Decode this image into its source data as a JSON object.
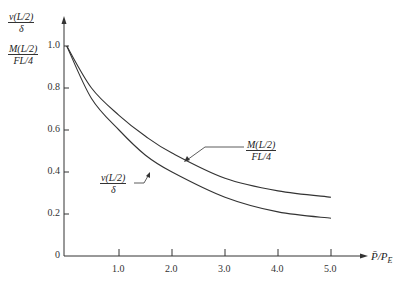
{
  "chart_data": {
    "type": "line",
    "title": "",
    "xlabel": "P̄/P_E",
    "ylabel": [
      "v(L/2)/δ",
      "M(L/2)/(FL/4)"
    ],
    "xlim": [
      0,
      5.6
    ],
    "ylim": [
      0,
      1.05
    ],
    "x_ticks": [
      "1.0",
      "2.0",
      "3.0",
      "4.0",
      "5.0"
    ],
    "y_ticks": [
      "0",
      "0.2",
      "0.4",
      "0.6",
      "0.8",
      "1.0"
    ],
    "grid": false,
    "legend": "inline annotations with leader lines",
    "x": [
      0.05,
      0.5,
      1.0,
      1.5,
      2.0,
      3.0,
      4.0,
      5.0
    ],
    "series": [
      {
        "name": "M(L/2)/(FL/4)",
        "values": [
          1.0,
          0.8,
          0.67,
          0.57,
          0.49,
          0.37,
          0.31,
          0.28
        ]
      },
      {
        "name": "v(L/2)/δ",
        "values": [
          1.0,
          0.75,
          0.6,
          0.48,
          0.4,
          0.28,
          0.21,
          0.18
        ]
      }
    ]
  },
  "labels": {
    "y_top": {
      "num": "v(L/2)",
      "den": "δ"
    },
    "y_mid": {
      "num": "M(L/2)",
      "den": "FL/4"
    },
    "curve_M": {
      "num": "M(L/2)",
      "den": "FL/4"
    },
    "curve_v": {
      "num": "v(L/2)",
      "den": "δ"
    },
    "x_axis": "P̄/P",
    "x_axis_sub": "E"
  }
}
